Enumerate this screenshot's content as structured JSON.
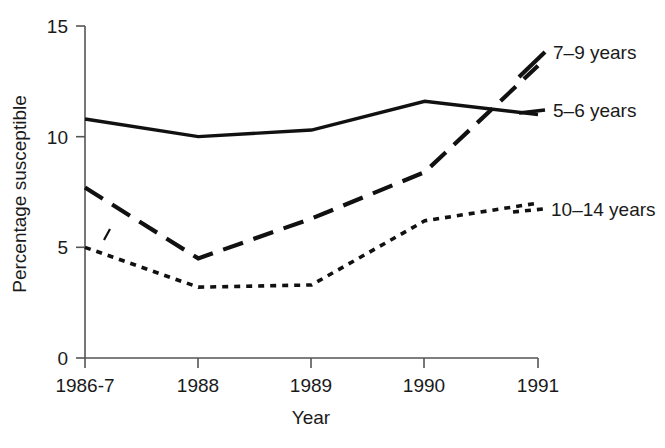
{
  "chart_data": {
    "type": "line",
    "title": "",
    "xlabel": "Year",
    "ylabel": "Percentage susceptible",
    "categories": [
      "1986-7",
      "1988",
      "1989",
      "1990",
      "1991"
    ],
    "ylim": [
      0,
      15
    ],
    "yticks": [
      0,
      5,
      10,
      15
    ],
    "ytick_labels": [
      "0",
      "5",
      "10",
      "15"
    ],
    "grid": false,
    "legend_position": "right-of-plot-inline",
    "series": [
      {
        "name": "5–6 years",
        "style": "solid",
        "values": [
          10.8,
          10.0,
          10.3,
          11.6,
          11.0
        ]
      },
      {
        "name": "7–9 years",
        "style": "dashed",
        "values": [
          7.7,
          4.5,
          6.3,
          8.4,
          13.2
        ]
      },
      {
        "name": "10–14 years",
        "style": "dotted",
        "values": [
          5.0,
          3.2,
          3.3,
          6.2,
          7.0
        ]
      }
    ]
  },
  "axes": {
    "y_title": "Percentage susceptible",
    "x_title": "Year",
    "y_labels": [
      "15",
      "10",
      "5",
      "0"
    ],
    "x_labels": [
      "1986-7",
      "1988",
      "1989",
      "1990",
      "1991"
    ]
  },
  "legend": {
    "items": [
      {
        "label": "7–9 years",
        "style": "dashed"
      },
      {
        "label": "5–6 years",
        "style": "solid"
      },
      {
        "label": "10–14 years",
        "style": "dotted"
      }
    ]
  },
  "colors": {
    "line": "#111111",
    "axis": "#555555",
    "text": "#1a1a1a",
    "background": "#ffffff"
  }
}
